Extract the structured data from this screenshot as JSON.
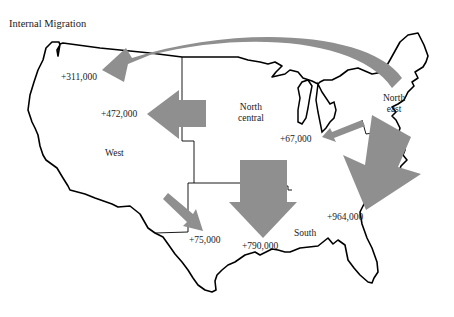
{
  "title": "Internal Migration",
  "colors": {
    "arrow": "#8f8f8f",
    "outline": "#000000",
    "background": "#ffffff"
  },
  "regions": {
    "west": "West",
    "north_central_line1": "North",
    "north_central_line2": "central",
    "northeast_line1": "North",
    "northeast_line2": "east",
    "south": "South"
  },
  "flows": [
    {
      "id": "northeast-to-west",
      "label": "+311,000",
      "from": "Northeast",
      "to": "West"
    },
    {
      "id": "north-central-to-west",
      "label": "+472,000",
      "from": "North central",
      "to": "West"
    },
    {
      "id": "northeast-to-north-central",
      "label": "+67,000",
      "from": "Northeast",
      "to": "North central"
    },
    {
      "id": "northeast-to-south",
      "label": "+964,000",
      "from": "Northeast",
      "to": "South"
    },
    {
      "id": "north-central-to-south",
      "label": "+790,000",
      "from": "North central",
      "to": "South"
    },
    {
      "id": "west-to-south",
      "label": "+75,000",
      "from": "West",
      "to": "South"
    }
  ]
}
